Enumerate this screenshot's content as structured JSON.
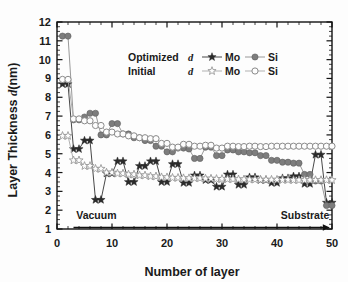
{
  "chart_data": {
    "type": "line",
    "title": "",
    "xlabel": "Number of layer",
    "ylabel": "Layer Thickness d(nm)",
    "ylabel_plain": "Layer Thickness ",
    "ylabel_italic": "d",
    "ylabel_tail": "(nm)",
    "xlim": [
      0,
      50
    ],
    "ylim": [
      1,
      12
    ],
    "xticks": [
      0,
      10,
      20,
      30,
      40,
      50
    ],
    "yticks": [
      1,
      2,
      3,
      4,
      5,
      6,
      7,
      8,
      9,
      10,
      11,
      12
    ],
    "x_minor_interval": 2,
    "y_minor_interval": 0.25,
    "grid": false,
    "legend_position": "upper-center",
    "annotations": [
      {
        "name": "vacuum-label",
        "text": "Vacuum",
        "x": 4,
        "y": 1.35
      },
      {
        "name": "substrate-label",
        "text": "Substrate",
        "x": 38,
        "y": 1.35
      },
      {
        "name": "direction-arrow",
        "text": "",
        "x0": 3,
        "x1": 50,
        "y": 1.0
      }
    ],
    "legend": {
      "row1": {
        "group_label": "Optimized",
        "group_symbol": "d",
        "entries": [
          {
            "label": "Mo",
            "marker": "star-filled",
            "color": "#2b2b2b"
          },
          {
            "label": "Si",
            "marker": "circle-filled",
            "color": "#7d7d7d"
          }
        ]
      },
      "row2": {
        "group_label": "Initial",
        "group_symbol": "d",
        "entries": [
          {
            "label": "Mo",
            "marker": "star-open",
            "color": "#9a9a9a"
          },
          {
            "label": "Si",
            "marker": "circle-open",
            "color": "#8a8a8a"
          }
        ]
      }
    },
    "x": [
      1,
      2,
      3,
      4,
      5,
      6,
      7,
      8,
      9,
      10,
      11,
      12,
      13,
      14,
      15,
      16,
      17,
      18,
      19,
      20,
      21,
      22,
      23,
      24,
      25,
      26,
      27,
      28,
      29,
      30,
      31,
      32,
      33,
      34,
      35,
      36,
      37,
      38,
      39,
      40,
      41,
      42,
      43,
      44,
      45,
      46,
      47,
      48,
      49,
      50
    ],
    "series": [
      {
        "name": "Optimized d Mo",
        "marker": "star-filled",
        "color": "#2b2b2b",
        "values": [
          8.7,
          8.7,
          5.25,
          5.25,
          5.7,
          5.7,
          2.55,
          2.55,
          3.95,
          3.95,
          4.6,
          4.6,
          3.5,
          3.5,
          4.35,
          4.35,
          4.6,
          4.6,
          3.5,
          3.5,
          4.45,
          4.45,
          3.45,
          3.45,
          3.85,
          3.85,
          3.6,
          3.6,
          3.25,
          3.25,
          3.9,
          3.9,
          3.35,
          3.35,
          3.75,
          3.75,
          3.6,
          3.6,
          3.45,
          3.45,
          3.7,
          3.7,
          3.8,
          3.8,
          3.4,
          3.4,
          4.95,
          4.95,
          2.4,
          2.4
        ]
      },
      {
        "name": "Optimized d Si",
        "marker": "circle-filled",
        "color": "#7d7d7d",
        "values": [
          11.25,
          11.25,
          6.8,
          6.8,
          6.95,
          7.15,
          7.15,
          6.0,
          6.0,
          6.6,
          6.6,
          6.05,
          6.05,
          5.85,
          5.85,
          5.7,
          5.7,
          5.4,
          5.4,
          5.1,
          5.1,
          5.3,
          5.3,
          5.25,
          4.75,
          4.75,
          5.35,
          5.35,
          4.9,
          4.9,
          5.2,
          5.2,
          5.1,
          5.1,
          5.05,
          5.05,
          4.9,
          4.9,
          4.65,
          4.65,
          4.55,
          4.55,
          4.5,
          4.5,
          3.9,
          3.9,
          3.55,
          3.55,
          2.25,
          2.25
        ]
      },
      {
        "name": "Initial d Mo",
        "marker": "star-open",
        "color": "#9a9a9a",
        "values": [
          5.95,
          5.95,
          4.65,
          4.65,
          4.35,
          4.35,
          4.2,
          4.2,
          4.0,
          4.0,
          3.95,
          3.95,
          3.9,
          3.9,
          3.85,
          3.85,
          3.8,
          3.8,
          3.75,
          3.75,
          3.72,
          3.72,
          3.7,
          3.7,
          3.7,
          3.7,
          3.68,
          3.68,
          3.66,
          3.66,
          3.65,
          3.65,
          3.64,
          3.64,
          3.63,
          3.63,
          3.62,
          3.62,
          3.62,
          3.62,
          3.61,
          3.61,
          3.6,
          3.6,
          3.6,
          3.6,
          3.6,
          3.6,
          3.6,
          3.6
        ]
      },
      {
        "name": "Initial d Si",
        "marker": "circle-open",
        "color": "#8a8a8a",
        "values": [
          8.95,
          8.95,
          6.85,
          6.85,
          6.75,
          6.75,
          6.5,
          6.5,
          6.15,
          6.15,
          6.05,
          6.05,
          5.95,
          5.95,
          5.85,
          5.85,
          5.8,
          5.8,
          5.55,
          5.55,
          5.35,
          5.35,
          5.5,
          5.5,
          5.4,
          5.4,
          5.45,
          5.45,
          5.3,
          5.3,
          5.4,
          5.4,
          5.38,
          5.38,
          5.4,
          5.4,
          5.38,
          5.38,
          5.4,
          5.4,
          5.4,
          5.4,
          5.4,
          5.4,
          5.4,
          5.4,
          5.4,
          5.4,
          5.4,
          5.4
        ]
      }
    ]
  }
}
